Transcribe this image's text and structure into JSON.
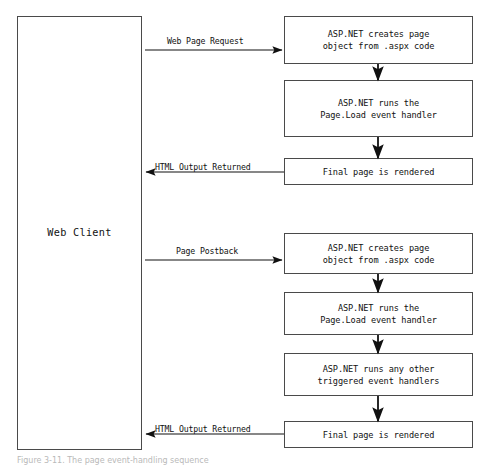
{
  "diagram": {
    "caption": "Figure 3-11. The page event-handling sequence",
    "colors": {
      "box_border": "#4a4a4a",
      "box_fill": "#ffffff",
      "connector": "#111111",
      "text": "#111111",
      "background": "#ffffff"
    },
    "client": {
      "label": "Web Client",
      "x": 17,
      "y": 16,
      "width": 125,
      "height": 434
    },
    "nodes": [
      {
        "id": "req-create",
        "label": "ASP.NET creates page\nobject from .aspx code",
        "x": 284,
        "y": 16,
        "width": 189,
        "height": 48,
        "group": "request"
      },
      {
        "id": "req-load",
        "label": "ASP.NET runs the\nPage.Load event handler",
        "x": 284,
        "y": 80,
        "width": 189,
        "height": 57,
        "group": "request"
      },
      {
        "id": "req-render",
        "label": "Final page is rendered",
        "x": 284,
        "y": 158,
        "width": 189,
        "height": 27,
        "group": "request"
      },
      {
        "id": "post-create",
        "label": "ASP.NET creates page\nobject from .aspx code",
        "x": 284,
        "y": 233,
        "width": 189,
        "height": 41,
        "group": "postback"
      },
      {
        "id": "post-load",
        "label": "ASP.NET runs the\nPage.Load event handler",
        "x": 284,
        "y": 292,
        "width": 189,
        "height": 43,
        "group": "postback"
      },
      {
        "id": "post-other",
        "label": "ASP.NET runs any other\ntriggered event handlers",
        "x": 284,
        "y": 353,
        "width": 189,
        "height": 43,
        "group": "postback"
      },
      {
        "id": "post-render",
        "label": "Final page is rendered",
        "x": 284,
        "y": 421,
        "width": 189,
        "height": 27,
        "group": "postback"
      }
    ],
    "edges": [
      {
        "id": "edge-web-page-request",
        "label": "Web Page Request",
        "direction": "right",
        "from": "client",
        "to": "req-create",
        "label_x": 167,
        "label_y": 36,
        "line_x1": 145,
        "line_x2": 282,
        "line_y": 50
      },
      {
        "id": "edge-html-output-returned-1",
        "label": "HTML Output Returned",
        "direction": "left",
        "from": "req-render",
        "to": "client",
        "label_x": 155,
        "label_y": 162,
        "line_x1": 284,
        "line_x2": 146,
        "line_y": 172
      },
      {
        "id": "edge-page-postback",
        "label": "Page Postback",
        "direction": "right",
        "from": "client",
        "to": "post-create",
        "label_x": 176,
        "label_y": 246,
        "line_x1": 145,
        "line_x2": 282,
        "line_y": 260
      },
      {
        "id": "edge-html-output-returned-2",
        "label": "HTML Output Returned",
        "direction": "left",
        "from": "post-render",
        "to": "client",
        "label_x": 155,
        "label_y": 424,
        "line_x1": 284,
        "line_x2": 146,
        "line_y": 434
      }
    ],
    "flow_arrows": [
      {
        "id": "flow-req-create-to-load",
        "x": 378,
        "y1": 64,
        "y2": 80
      },
      {
        "id": "flow-req-load-to-render",
        "x": 378,
        "y1": 137,
        "y2": 158
      },
      {
        "id": "flow-post-create-to-load",
        "x": 378,
        "y1": 274,
        "y2": 292
      },
      {
        "id": "flow-post-load-to-other",
        "x": 378,
        "y1": 335,
        "y2": 353
      },
      {
        "id": "flow-post-other-to-render",
        "x": 378,
        "y1": 396,
        "y2": 421
      }
    ]
  }
}
